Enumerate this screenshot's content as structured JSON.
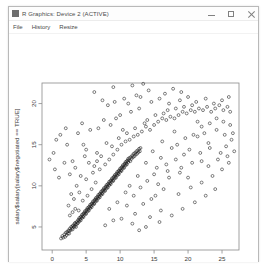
{
  "window": {
    "title": "R Graphics: Device 2 (ACTIVE)",
    "icon": "app-icon",
    "controls": {
      "minimize": "minimize-icon",
      "maximize": "maximize-icon",
      "close": "close-icon"
    }
  },
  "menu": {
    "items": [
      {
        "label": "File"
      },
      {
        "label": "History"
      },
      {
        "label": "Resize"
      }
    ]
  },
  "chart_data": {
    "type": "scatter",
    "title": "",
    "xlabel": "salary$incentive[salary$negotiated == TRUE]",
    "ylabel": "salary$salary[salary$negotiated == TRUE]",
    "xlim": [
      -1.5,
      27.5
    ],
    "ylim": [
      2.2,
      22.5
    ],
    "xticks": [
      0,
      5,
      10,
      15,
      20,
      25
    ],
    "yticks": [
      5,
      10,
      15,
      20
    ],
    "grid": false,
    "legend": null,
    "point_style": {
      "symbol": "open-circle",
      "color": "#1a1a1a",
      "radius": 1.45,
      "stroke_width": 0.55
    },
    "points": [
      [
        1.3,
        3.6
      ],
      [
        1.5,
        3.9
      ],
      [
        1.6,
        3.7
      ],
      [
        1.8,
        4.1
      ],
      [
        1.9,
        3.8
      ],
      [
        2.0,
        4.3
      ],
      [
        2.1,
        4.0
      ],
      [
        2.2,
        4.4
      ],
      [
        2.3,
        4.2
      ],
      [
        2.4,
        4.6
      ],
      [
        2.5,
        4.5
      ],
      [
        2.5,
        4.2
      ],
      [
        2.6,
        4.8
      ],
      [
        2.7,
        4.6
      ],
      [
        2.8,
        5.0
      ],
      [
        2.9,
        4.8
      ],
      [
        3.0,
        5.1
      ],
      [
        3.0,
        4.7
      ],
      [
        3.1,
        5.2
      ],
      [
        3.2,
        5.0
      ],
      [
        3.3,
        5.4
      ],
      [
        3.3,
        5.1
      ],
      [
        3.4,
        5.5
      ],
      [
        3.5,
        5.3
      ],
      [
        3.5,
        5.0
      ],
      [
        3.6,
        5.6
      ],
      [
        3.7,
        5.4
      ],
      [
        3.8,
        5.8
      ],
      [
        3.8,
        5.5
      ],
      [
        3.9,
        5.9
      ],
      [
        4.0,
        5.7
      ],
      [
        4.0,
        6.1
      ],
      [
        4.1,
        5.9
      ],
      [
        4.2,
        6.2
      ],
      [
        4.2,
        5.8
      ],
      [
        4.3,
        6.3
      ],
      [
        4.4,
        6.1
      ],
      [
        4.4,
        6.5
      ],
      [
        4.5,
        6.3
      ],
      [
        4.6,
        6.6
      ],
      [
        4.6,
        6.2
      ],
      [
        4.7,
        6.7
      ],
      [
        4.8,
        6.5
      ],
      [
        4.8,
        6.9
      ],
      [
        4.9,
        6.7
      ],
      [
        5.0,
        7.0
      ],
      [
        5.0,
        6.6
      ],
      [
        5.1,
        7.1
      ],
      [
        5.2,
        6.9
      ],
      [
        5.2,
        7.3
      ],
      [
        5.3,
        7.1
      ],
      [
        5.4,
        7.4
      ],
      [
        5.4,
        7.0
      ],
      [
        5.5,
        7.5
      ],
      [
        5.6,
        7.3
      ],
      [
        5.6,
        7.7
      ],
      [
        5.7,
        7.5
      ],
      [
        5.8,
        7.8
      ],
      [
        5.8,
        7.4
      ],
      [
        5.9,
        7.9
      ],
      [
        6.0,
        7.7
      ],
      [
        6.0,
        8.1
      ],
      [
        6.1,
        7.9
      ],
      [
        6.2,
        8.2
      ],
      [
        6.2,
        7.8
      ],
      [
        6.3,
        8.3
      ],
      [
        6.4,
        8.1
      ],
      [
        6.4,
        8.5
      ],
      [
        6.5,
        8.3
      ],
      [
        6.6,
        8.6
      ],
      [
        6.6,
        8.2
      ],
      [
        6.7,
        8.7
      ],
      [
        6.8,
        8.5
      ],
      [
        6.8,
        8.9
      ],
      [
        6.9,
        8.7
      ],
      [
        7.0,
        9.0
      ],
      [
        7.0,
        8.6
      ],
      [
        7.1,
        9.1
      ],
      [
        7.2,
        8.9
      ],
      [
        7.2,
        9.3
      ],
      [
        7.3,
        9.1
      ],
      [
        7.4,
        9.4
      ],
      [
        7.4,
        9.0
      ],
      [
        7.5,
        9.5
      ],
      [
        7.6,
        9.3
      ],
      [
        7.6,
        9.7
      ],
      [
        7.7,
        9.5
      ],
      [
        7.8,
        9.8
      ],
      [
        7.8,
        9.4
      ],
      [
        7.9,
        9.9
      ],
      [
        8.0,
        9.7
      ],
      [
        8.0,
        10.1
      ],
      [
        8.1,
        9.9
      ],
      [
        8.2,
        10.2
      ],
      [
        8.2,
        9.8
      ],
      [
        8.3,
        10.3
      ],
      [
        8.4,
        10.1
      ],
      [
        8.4,
        10.5
      ],
      [
        8.5,
        10.3
      ],
      [
        8.6,
        10.6
      ],
      [
        8.6,
        10.2
      ],
      [
        8.7,
        10.7
      ],
      [
        8.8,
        10.5
      ],
      [
        8.8,
        10.9
      ],
      [
        8.9,
        10.7
      ],
      [
        9.0,
        11.0
      ],
      [
        9.0,
        10.6
      ],
      [
        9.1,
        11.1
      ],
      [
        9.2,
        10.9
      ],
      [
        9.2,
        11.3
      ],
      [
        9.3,
        11.1
      ],
      [
        9.4,
        11.4
      ],
      [
        9.4,
        11.0
      ],
      [
        9.5,
        11.5
      ],
      [
        9.6,
        11.3
      ],
      [
        9.6,
        11.7
      ],
      [
        9.7,
        11.5
      ],
      [
        9.8,
        11.8
      ],
      [
        9.8,
        11.4
      ],
      [
        9.9,
        11.9
      ],
      [
        10.0,
        11.7
      ],
      [
        10.0,
        12.1
      ],
      [
        10.1,
        11.9
      ],
      [
        10.2,
        12.2
      ],
      [
        10.2,
        11.8
      ],
      [
        10.3,
        12.3
      ],
      [
        10.4,
        12.1
      ],
      [
        10.4,
        12.5
      ],
      [
        10.5,
        12.3
      ],
      [
        10.6,
        12.6
      ],
      [
        10.6,
        12.2
      ],
      [
        10.7,
        12.7
      ],
      [
        10.8,
        12.5
      ],
      [
        10.8,
        12.9
      ],
      [
        10.9,
        12.7
      ],
      [
        11.0,
        13.0
      ],
      [
        11.0,
        12.6
      ],
      [
        11.1,
        13.1
      ],
      [
        11.2,
        12.9
      ],
      [
        11.2,
        13.3
      ],
      [
        11.3,
        13.1
      ],
      [
        11.4,
        13.4
      ],
      [
        11.5,
        13.0
      ],
      [
        11.6,
        13.5
      ],
      [
        11.7,
        13.3
      ],
      [
        11.8,
        13.7
      ],
      [
        11.9,
        13.5
      ],
      [
        12.0,
        13.9
      ],
      [
        12.1,
        13.6
      ],
      [
        12.2,
        14.0
      ],
      [
        12.3,
        13.8
      ],
      [
        12.4,
        14.2
      ],
      [
        12.5,
        13.9
      ],
      [
        12.6,
        14.3
      ],
      [
        12.7,
        14.1
      ],
      [
        12.8,
        14.5
      ],
      [
        12.9,
        14.2
      ],
      [
        13.0,
        14.6
      ],
      [
        2.6,
        6.4
      ],
      [
        3.0,
        6.8
      ],
      [
        3.4,
        7.2
      ],
      [
        2.4,
        7.6
      ],
      [
        3.9,
        7.0
      ],
      [
        4.5,
        8.2
      ],
      [
        5.2,
        8.8
      ],
      [
        4.0,
        9.2
      ],
      [
        3.2,
        8.4
      ],
      [
        2.8,
        9.0
      ],
      [
        5.8,
        9.6
      ],
      [
        6.4,
        10.4
      ],
      [
        5.0,
        10.8
      ],
      [
        4.2,
        11.2
      ],
      [
        3.6,
        10.0
      ],
      [
        6.0,
        11.6
      ],
      [
        7.0,
        12.0
      ],
      [
        6.2,
        12.4
      ],
      [
        5.4,
        12.8
      ],
      [
        7.8,
        12.6
      ],
      [
        8.4,
        13.2
      ],
      [
        7.2,
        13.6
      ],
      [
        6.6,
        14.0
      ],
      [
        9.0,
        13.8
      ],
      [
        9.6,
        14.4
      ],
      [
        8.8,
        14.8
      ],
      [
        8.0,
        15.2
      ],
      [
        10.2,
        15.0
      ],
      [
        10.8,
        15.4
      ],
      [
        9.8,
        15.8
      ],
      [
        11.4,
        15.6
      ],
      [
        12.0,
        16.0
      ],
      [
        11.0,
        16.4
      ],
      [
        12.6,
        16.2
      ],
      [
        13.2,
        16.6
      ],
      [
        12.2,
        17.0
      ],
      [
        10.4,
        16.8
      ],
      [
        13.8,
        17.2
      ],
      [
        14.4,
        16.8
      ],
      [
        13.6,
        17.6
      ],
      [
        15.0,
        17.4
      ],
      [
        14.0,
        18.0
      ],
      [
        15.6,
        17.8
      ],
      [
        16.2,
        18.2
      ],
      [
        15.2,
        18.6
      ],
      [
        16.8,
        18.0
      ],
      [
        17.4,
        18.4
      ],
      [
        16.4,
        18.8
      ],
      [
        18.0,
        18.2
      ],
      [
        17.0,
        19.2
      ],
      [
        18.6,
        18.6
      ],
      [
        19.2,
        19.0
      ],
      [
        18.2,
        19.4
      ],
      [
        19.8,
        18.8
      ],
      [
        20.4,
        19.2
      ],
      [
        19.4,
        19.6
      ],
      [
        21.0,
        19.0
      ],
      [
        21.6,
        19.4
      ],
      [
        20.6,
        19.8
      ],
      [
        22.2,
        19.2
      ],
      [
        22.8,
        19.6
      ],
      [
        23.4,
        19.0
      ],
      [
        24.0,
        19.4
      ],
      [
        24.6,
        19.8
      ],
      [
        25.2,
        19.2
      ],
      [
        25.8,
        19.6
      ],
      [
        26.2,
        19.0
      ],
      [
        0.2,
        14.0
      ],
      [
        0.6,
        15.6
      ],
      [
        1.2,
        16.2
      ],
      [
        -0.4,
        13.2
      ],
      [
        1.8,
        12.8
      ],
      [
        2.2,
        15.0
      ],
      [
        3.0,
        13.0
      ],
      [
        2.0,
        17.0
      ],
      [
        3.8,
        16.4
      ],
      [
        4.6,
        15.0
      ],
      [
        5.6,
        16.8
      ],
      [
        4.4,
        17.6
      ],
      [
        6.8,
        17.0
      ],
      [
        7.6,
        18.0
      ],
      [
        8.6,
        17.4
      ],
      [
        9.4,
        18.2
      ],
      [
        10.0,
        18.6
      ],
      [
        11.6,
        19.0
      ],
      [
        12.8,
        19.4
      ],
      [
        8.2,
        19.8
      ],
      [
        9.2,
        20.2
      ],
      [
        10.6,
        20.6
      ],
      [
        11.2,
        20.0
      ],
      [
        7.4,
        20.4
      ],
      [
        13.0,
        20.8
      ],
      [
        14.6,
        20.2
      ],
      [
        12.4,
        21.0
      ],
      [
        6.2,
        21.4
      ],
      [
        15.8,
        20.6
      ],
      [
        17.2,
        20.0
      ],
      [
        18.8,
        20.4
      ],
      [
        20.0,
        20.8
      ],
      [
        21.2,
        20.2
      ],
      [
        22.6,
        20.6
      ],
      [
        23.8,
        20.0
      ],
      [
        25.0,
        20.4
      ],
      [
        26.0,
        20.8
      ],
      [
        9.0,
        22.0
      ],
      [
        14.2,
        21.6
      ],
      [
        16.6,
        21.2
      ],
      [
        11.8,
        22.2
      ],
      [
        13.4,
        22.4
      ],
      [
        17.8,
        21.8
      ],
      [
        19.0,
        21.4
      ],
      [
        4.8,
        13.6
      ],
      [
        3.4,
        12.2
      ],
      [
        5.0,
        14.4
      ],
      [
        6.6,
        13.0
      ],
      [
        1.0,
        11.0
      ],
      [
        0.4,
        12.0
      ],
      [
        2.6,
        11.4
      ],
      [
        15.4,
        12.2
      ],
      [
        16.0,
        13.4
      ],
      [
        14.8,
        14.2
      ],
      [
        17.6,
        14.6
      ],
      [
        16.2,
        15.4
      ],
      [
        18.4,
        15.0
      ],
      [
        19.6,
        15.8
      ],
      [
        20.8,
        16.2
      ],
      [
        18.0,
        16.6
      ],
      [
        21.4,
        16.0
      ],
      [
        22.4,
        16.4
      ],
      [
        23.0,
        15.2
      ],
      [
        24.2,
        16.8
      ],
      [
        25.4,
        16.2
      ],
      [
        26.4,
        15.6
      ],
      [
        13.8,
        12.8
      ],
      [
        15.0,
        11.4
      ],
      [
        16.8,
        12.6
      ],
      [
        18.2,
        13.2
      ],
      [
        19.4,
        13.8
      ],
      [
        20.2,
        14.4
      ],
      [
        21.8,
        14.0
      ],
      [
        23.2,
        14.6
      ],
      [
        24.8,
        14.0
      ],
      [
        22.0,
        13.0
      ],
      [
        17.0,
        11.8
      ],
      [
        19.0,
        12.2
      ],
      [
        20.6,
        12.8
      ],
      [
        25.6,
        14.8
      ],
      [
        26.6,
        16.4
      ],
      [
        12.6,
        11.2
      ],
      [
        14.0,
        10.6
      ],
      [
        13.0,
        9.8
      ],
      [
        15.6,
        10.2
      ],
      [
        11.4,
        10.0
      ],
      [
        16.4,
        9.6
      ],
      [
        10.8,
        9.2
      ],
      [
        12.0,
        8.8
      ],
      [
        14.6,
        8.4
      ],
      [
        17.2,
        11.0
      ],
      [
        18.8,
        11.6
      ],
      [
        20.0,
        11.0
      ],
      [
        9.6,
        8.0
      ],
      [
        11.0,
        7.6
      ],
      [
        8.4,
        7.2
      ],
      [
        13.4,
        7.8
      ],
      [
        15.2,
        8.8
      ],
      [
        12.2,
        6.6
      ],
      [
        14.4,
        6.2
      ],
      [
        16.0,
        7.0
      ],
      [
        10.2,
        6.0
      ],
      [
        11.8,
        5.4
      ],
      [
        9.0,
        5.8
      ],
      [
        7.8,
        5.2
      ],
      [
        13.8,
        5.0
      ],
      [
        12.8,
        4.6
      ],
      [
        15.8,
        5.6
      ],
      [
        17.6,
        6.4
      ],
      [
        19.2,
        7.2
      ],
      [
        21.0,
        8.0
      ],
      [
        22.6,
        8.8
      ],
      [
        24.0,
        9.6
      ],
      [
        18.6,
        9.0
      ],
      [
        20.4,
        9.8
      ],
      [
        22.0,
        10.4
      ],
      [
        23.6,
        11.2
      ],
      [
        25.0,
        12.0
      ],
      [
        26.0,
        12.8
      ],
      [
        23.0,
        12.4
      ],
      [
        24.4,
        13.2
      ],
      [
        25.8,
        13.6
      ],
      [
        26.8,
        14.2
      ],
      [
        26.2,
        17.4
      ],
      [
        25.2,
        17.8
      ],
      [
        24.2,
        18.2
      ],
      [
        23.2,
        17.6
      ],
      [
        22.0,
        17.2
      ],
      [
        21.4,
        17.8
      ]
    ]
  }
}
